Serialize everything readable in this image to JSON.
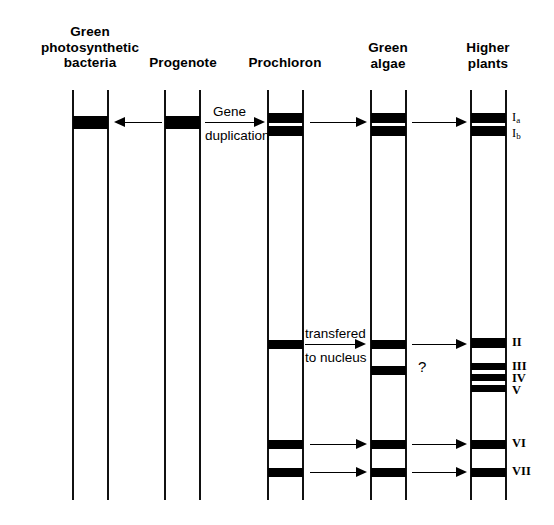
{
  "figure": {
    "background": "#ffffff",
    "ink": "#000000"
  },
  "columns": [
    {
      "id": "green-photosynthetic-bacteria",
      "label": "Green\nphotosynthetic\nbacteria",
      "lane_x": 72,
      "lane_width": 37,
      "header_center_x": 90,
      "header_top": 24,
      "header_width": 140
    },
    {
      "id": "progenote",
      "label": "Progenote",
      "lane_x": 164,
      "lane_width": 37,
      "header_center_x": 183,
      "header_top": 55,
      "header_width": 110
    },
    {
      "id": "prochloron",
      "label": "Prochloron",
      "lane_x": 267,
      "lane_width": 37,
      "header_center_x": 285,
      "header_top": 55,
      "header_width": 118
    },
    {
      "id": "green-algae",
      "label": "Green\nalgae",
      "lane_x": 370,
      "lane_width": 37,
      "header_center_x": 388,
      "header_top": 40,
      "header_width": 100
    },
    {
      "id": "higher-plants",
      "label": "Higher\nplants",
      "lane_x": 470,
      "lane_width": 37,
      "header_center_x": 488,
      "header_top": 40,
      "header_width": 100
    }
  ],
  "lane_geometry": {
    "top": 90,
    "bottom": 500
  },
  "bands": {
    "green-photosynthetic-bacteria": [
      {
        "id": "gpb-band-1",
        "y": 116,
        "height": 13
      }
    ],
    "progenote": [
      {
        "id": "pro-band-1",
        "y": 116,
        "height": 13
      }
    ],
    "prochloron": [
      {
        "id": "prc-band-Ia",
        "y": 113,
        "height": 10
      },
      {
        "id": "prc-band-Ib",
        "y": 126,
        "height": 10
      },
      {
        "id": "prc-band-II",
        "y": 340,
        "height": 9
      },
      {
        "id": "prc-band-VI",
        "y": 440,
        "height": 9
      },
      {
        "id": "prc-band-VII",
        "y": 468,
        "height": 9
      }
    ],
    "green-algae": [
      {
        "id": "ga-band-Ia",
        "y": 113,
        "height": 10
      },
      {
        "id": "ga-band-Ib",
        "y": 126,
        "height": 10
      },
      {
        "id": "ga-band-II",
        "y": 340,
        "height": 9
      },
      {
        "id": "ga-band-q",
        "y": 366,
        "height": 9
      },
      {
        "id": "ga-band-VI",
        "y": 440,
        "height": 9
      },
      {
        "id": "ga-band-VII",
        "y": 468,
        "height": 9
      }
    ],
    "higher-plants": [
      {
        "id": "hp-band-Ia",
        "y": 113,
        "height": 10
      },
      {
        "id": "hp-band-Ib",
        "y": 126,
        "height": 10
      },
      {
        "id": "hp-band-II",
        "y": 338,
        "height": 10
      },
      {
        "id": "hp-band-III",
        "y": 363,
        "height": 7
      },
      {
        "id": "hp-band-IV",
        "y": 374,
        "height": 7
      },
      {
        "id": "hp-band-V",
        "y": 385,
        "height": 7
      },
      {
        "id": "hp-band-VI",
        "y": 440,
        "height": 9
      },
      {
        "id": "hp-band-VII",
        "y": 468,
        "height": 9
      }
    ]
  },
  "band_labels": [
    {
      "id": "label-Ia",
      "text": "I",
      "sub": "a",
      "x": 512,
      "y": 111,
      "bold": false
    },
    {
      "id": "label-Ib",
      "text": "I",
      "sub": "b",
      "x": 512,
      "y": 127,
      "bold": false
    },
    {
      "id": "label-II",
      "text": "II",
      "sub": "",
      "x": 512,
      "y": 336,
      "bold": true
    },
    {
      "id": "label-III",
      "text": "III",
      "sub": "",
      "x": 512,
      "y": 360,
      "bold": true
    },
    {
      "id": "label-IV",
      "text": "IV",
      "sub": "",
      "x": 512,
      "y": 372,
      "bold": true
    },
    {
      "id": "label-V",
      "text": "V",
      "sub": "",
      "x": 512,
      "y": 384,
      "bold": true
    },
    {
      "id": "label-VI",
      "text": "VI",
      "sub": "",
      "x": 512,
      "y": 437,
      "bold": true
    },
    {
      "id": "label-VII",
      "text": "VII",
      "sub": "",
      "x": 512,
      "y": 465,
      "bold": true
    }
  ],
  "arrows": [
    {
      "id": "arrow-progenote-to-bacteria",
      "direction": "left",
      "x1": 114,
      "x2": 162,
      "y": 122
    },
    {
      "id": "arrow-gene-duplication",
      "direction": "right",
      "x1": 205,
      "x2": 265,
      "y": 122
    },
    {
      "id": "arrow-prochloron-to-algae",
      "direction": "right",
      "x1": 310,
      "x2": 367,
      "y": 122
    },
    {
      "id": "arrow-algae-to-plants",
      "direction": "right",
      "x1": 412,
      "x2": 467,
      "y": 122
    },
    {
      "id": "arrow-transfered-to-nucleus",
      "direction": "right",
      "x1": 305,
      "x2": 366,
      "y": 344
    },
    {
      "id": "arrow-algae-to-plants-II",
      "direction": "right",
      "x1": 412,
      "x2": 467,
      "y": 344
    },
    {
      "id": "arrow-prochloron-to-algae-VI",
      "direction": "right",
      "x1": 310,
      "x2": 367,
      "y": 444
    },
    {
      "id": "arrow-algae-to-plants-VI",
      "direction": "right",
      "x1": 412,
      "x2": 467,
      "y": 444
    },
    {
      "id": "arrow-prochloron-to-algae-VII",
      "direction": "right",
      "x1": 310,
      "x2": 367,
      "y": 472
    },
    {
      "id": "arrow-algae-to-plants-VII",
      "direction": "right",
      "x1": 412,
      "x2": 467,
      "y": 472
    }
  ],
  "annotations": [
    {
      "id": "gene-duplication-top",
      "text": "Gene",
      "x": 213,
      "y": 104
    },
    {
      "id": "gene-duplication-bottom",
      "text": "duplication",
      "x": 205,
      "y": 128
    },
    {
      "id": "transfered-top",
      "text": "transfered",
      "x": 305,
      "y": 326
    },
    {
      "id": "transfered-bottom",
      "text": "to nucleus",
      "x": 305,
      "y": 350
    },
    {
      "id": "question-mark",
      "text": "?",
      "x": 418,
      "y": 358
    }
  ]
}
